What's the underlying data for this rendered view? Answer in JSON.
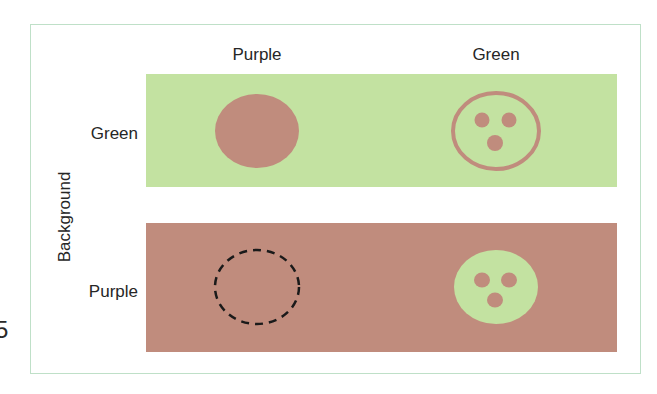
{
  "diagram": {
    "column_headers": [
      "Purple",
      "Green"
    ],
    "row_headers": [
      "Green",
      "Purple"
    ],
    "axis_label": "Background",
    "stray_char": "5",
    "colors": {
      "green": "#c3e2a1",
      "purple": "#c08c7d",
      "frame": "#bfe0c8",
      "dashed_outline": "#1a1a1a"
    },
    "cells": [
      {
        "row": "Green",
        "col": "Purple",
        "shape": "solid-ellipse",
        "fill": "purple"
      },
      {
        "row": "Green",
        "col": "Green",
        "shape": "ring-with-three-dots",
        "fill": "purple"
      },
      {
        "row": "Purple",
        "col": "Purple",
        "shape": "dashed-ellipse-outline",
        "fill": "none"
      },
      {
        "row": "Purple",
        "col": "Green",
        "shape": "solid-ellipse-with-three-holes",
        "fill": "green"
      }
    ]
  }
}
